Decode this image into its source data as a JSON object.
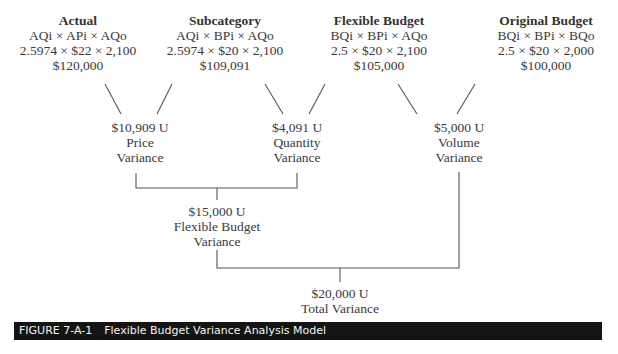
{
  "diagram": {
    "columns": [
      {
        "title": "Actual",
        "formula": "AQi × APi × AQo",
        "values": "2.5974 × $22 × 2,100",
        "amount": "$120,000"
      },
      {
        "title": "Subcategory",
        "formula": "AQi × BPi × AQo",
        "values": "2.5974 × $20 × 2,100",
        "amount": "$109,091"
      },
      {
        "title": "Flexible Budget",
        "formula": "BQi × BPi × AQo",
        "values": "2.5 × $20 × 2,100",
        "amount": "$105,000"
      },
      {
        "title": "Original Budget",
        "formula": "BQi × BPi × BQo",
        "values": "2.5 × $20 × 2,000",
        "amount": "$100,000"
      }
    ],
    "variances": [
      {
        "amount": "$10,909 U",
        "line1": "Price",
        "line2": "Variance"
      },
      {
        "amount": "$4,091 U",
        "line1": "Quantity",
        "line2": "Variance"
      },
      {
        "amount": "$5,000 U",
        "line1": "Volume",
        "line2": "Variance"
      }
    ],
    "flexible_budget_variance": {
      "amount": "$15,000 U",
      "line1": "Flexible Budget",
      "line2": "Variance"
    },
    "total_variance": {
      "amount": "$20,000 U",
      "line1": "Total Variance"
    }
  },
  "caption": {
    "figure_number": "FIGURE 7-A-1",
    "title": "Flexible Budget Variance Analysis Model"
  },
  "colors": {
    "line": "#555555",
    "text": "#3a3a3a",
    "caption_bg": "#141414",
    "caption_text": "#f2f2f2"
  }
}
